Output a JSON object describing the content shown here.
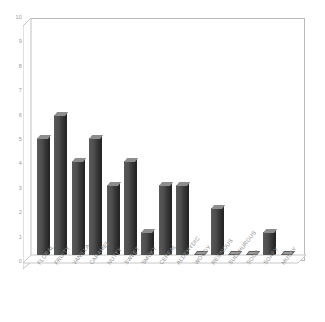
{
  "chart_data": {
    "type": "bar",
    "title": "",
    "subtitle": "",
    "xlabel": "",
    "ylabel": "",
    "ylim": [
      0,
      10
    ],
    "ytick_step": 1,
    "yticks": [
      "10",
      "9",
      "8",
      "7",
      "6",
      "5",
      "4",
      "3",
      "2",
      "1",
      "0"
    ],
    "grid": false,
    "legend": false,
    "legend_position": "none",
    "categories": [
      "FLORAL",
      "FRUITY",
      "VANILLA",
      "CARAMEL",
      "NUTTY",
      "SWEET",
      "SMOKY",
      "CEREAL",
      "ALDEHYDIC",
      "WOODY",
      "RESINOUS",
      "SULPHUROUS",
      "SOUR",
      "SOAPY",
      "MUSTY"
    ],
    "values": [
      5,
      6,
      4,
      5,
      3,
      4,
      1,
      3,
      3,
      0,
      2,
      0,
      0,
      1,
      0
    ],
    "series": [
      {
        "name": "count",
        "values": [
          5,
          6,
          4,
          5,
          3,
          4,
          1,
          3,
          3,
          0,
          2,
          0,
          0,
          1,
          0
        ]
      }
    ],
    "colors": {
      "bar_face": "#4a4a4a",
      "bar_top": "#8d8d8d",
      "bar_side": "#262626",
      "plot_border": "#b9b9b9",
      "tick_text": "#9a9a9a",
      "category_text": "#8e8e8e",
      "background": "#ffffff"
    }
  }
}
